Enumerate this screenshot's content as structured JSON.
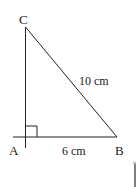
{
  "diagram": {
    "type": "right-triangle",
    "vertices": {
      "A": {
        "label": "A",
        "x": 25,
        "y": 137
      },
      "B": {
        "label": "B",
        "x": 117,
        "y": 137
      },
      "C": {
        "label": "C",
        "x": 25,
        "y": 27
      }
    },
    "right_angle_at": "A",
    "sides": {
      "AB": {
        "label": "6 cm"
      },
      "BC": {
        "label": "10 cm"
      }
    },
    "colors": {
      "stroke": "#222222",
      "text": "#1a1a1a",
      "background": "#ffffff"
    }
  }
}
